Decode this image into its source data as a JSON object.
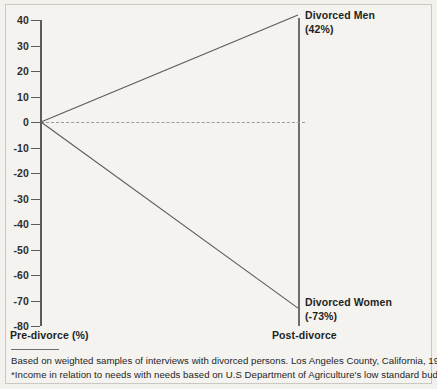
{
  "chart_data": {
    "type": "line",
    "title": "",
    "subtitle": "",
    "xlabel": "",
    "ylabel": "",
    "x": [
      "Pre-divorce",
      "Post-divorce"
    ],
    "xtick_labels": [
      "Pre-divorce (%)",
      "Post-divorce"
    ],
    "ylim": [
      -80,
      40
    ],
    "ytick_labels": [
      "40",
      "30",
      "20",
      "10",
      "0",
      "-10",
      "-20",
      "-30",
      "-40",
      "-50",
      "-60",
      "-70",
      "-80"
    ],
    "ytick_values": [
      40,
      30,
      20,
      10,
      0,
      -10,
      -20,
      -30,
      -40,
      -50,
      -60,
      -70,
      -80
    ],
    "grid": false,
    "legend_position": "inline-right",
    "reference_line": {
      "value": 0,
      "style": "dashed",
      "color": "#9a9a96"
    },
    "series": [
      {
        "name": "Divorced Men",
        "values": [
          0,
          42
        ],
        "end_label": "Divorced Men",
        "end_value_label": "(42%)",
        "color": "#5b5b58"
      },
      {
        "name": "Divorced Women",
        "values": [
          0,
          -73
        ],
        "end_label": "Divorced Women",
        "end_value_label": "(-73%)",
        "color": "#5b5b58"
      }
    ],
    "annotations": [
      "Based on weighted samples of interviews with divorced persons. Los Angeles County, California, 1978.",
      "*Income in relation to needs with needs based on U.S Department of Agriculture's low standard budget."
    ]
  },
  "axis": {
    "left_label": "Pre-divorce (%)",
    "right_label": "Post-divorce"
  },
  "labels": {
    "men_name": "Divorced Men",
    "men_value": "(42%)",
    "women_name": "Divorced Women",
    "women_value": "(-73%)"
  },
  "footnotes": {
    "line1": "Based on weighted samples of interviews with divorced persons. Los Angeles County, California, 1978.",
    "line2": "*Income in relation to needs with needs based on U.S Department of Agriculture's low standard budget."
  },
  "colors": {
    "background": "#f4f3f0",
    "axis": "#5b5b58",
    "line": "#5b5b58",
    "dashed": "#9a9a96",
    "text": "#1f1f1d"
  }
}
